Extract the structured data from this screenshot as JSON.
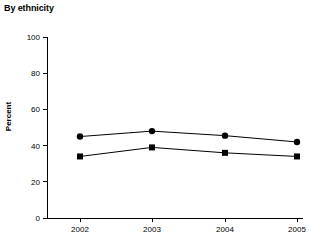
{
  "chart_data": {
    "type": "line",
    "title": "By ethnicity",
    "subtitle": "",
    "xlabel": "",
    "ylabel": "Percent",
    "categories": [
      "2002",
      "2003",
      "2004",
      "2005"
    ],
    "x_tick_labels": [
      "2002",
      "2003",
      "2004",
      "2005"
    ],
    "y_tick_labels": [
      "0",
      "20",
      "40",
      "60",
      "80",
      "100"
    ],
    "y_ticks": [
      0,
      20,
      40,
      60,
      80,
      100
    ],
    "ylim": [
      0,
      100
    ],
    "grid": false,
    "legend": "none",
    "series": [
      {
        "name": "series-circle",
        "marker": "circle",
        "color": "#000000",
        "values": [
          45,
          48,
          45.5,
          42
        ]
      },
      {
        "name": "series-square",
        "marker": "square",
        "color": "#000000",
        "values": [
          34,
          39,
          36,
          34
        ]
      }
    ]
  },
  "layout": {
    "plot_left": 47,
    "plot_right": 297,
    "plot_top": 37,
    "plot_bottom": 218,
    "tick_len": 4,
    "x_positions": [
      80,
      152,
      225,
      297
    ]
  }
}
